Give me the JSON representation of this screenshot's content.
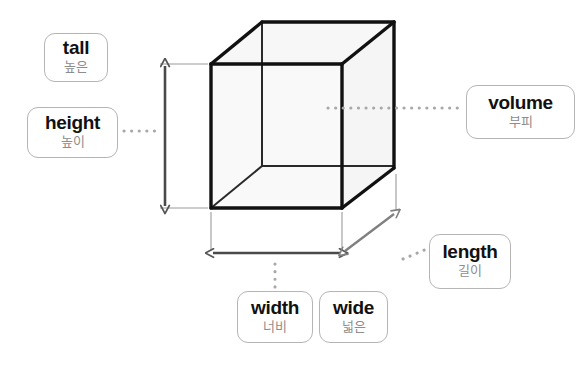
{
  "diagram": {
    "background_color": "#ffffff",
    "shape": {
      "name": "cube",
      "face_fill": "#f7f7f7",
      "edge_color": "#1a1a1a",
      "back_edge_color": "#222222"
    },
    "measure_color": "#555555",
    "connector_color": "#9a9a9a",
    "box_border_color": "#b5b5b5",
    "english_text_color": "#111111",
    "korean_text_color": "#8d8d8d"
  },
  "labels": {
    "tall": {
      "en": "tall",
      "ko": "높은"
    },
    "height": {
      "en": "height",
      "ko": "높이"
    },
    "volume": {
      "en": "volume",
      "ko": "부피"
    },
    "length": {
      "en": "length",
      "ko": "길이"
    },
    "width": {
      "en": "width",
      "ko": "너비"
    },
    "wide": {
      "en": "wide",
      "ko": "넓은"
    }
  },
  "measurements": [
    {
      "name": "height-dimension",
      "orientation": "vertical",
      "from": [
        165,
        65
      ],
      "to": [
        165,
        208
      ]
    },
    {
      "name": "width-dimension",
      "orientation": "horizontal",
      "from": [
        211,
        253
      ],
      "to": [
        342,
        253
      ]
    },
    {
      "name": "length-dimension",
      "orientation": "diagonal",
      "from": [
        342,
        253
      ],
      "to": [
        396,
        212
      ]
    }
  ],
  "connectors": [
    {
      "name": "height-connector",
      "from": [
        122,
        130
      ],
      "to": [
        160,
        130
      ]
    },
    {
      "name": "volume-connector",
      "from": [
        326,
        108
      ],
      "to": [
        462,
        108
      ]
    },
    {
      "name": "width-connector",
      "from": [
        275,
        262
      ],
      "to": [
        275,
        288
      ]
    },
    {
      "name": "length-connector",
      "from": [
        404,
        258
      ],
      "to": [
        426,
        248
      ]
    }
  ]
}
